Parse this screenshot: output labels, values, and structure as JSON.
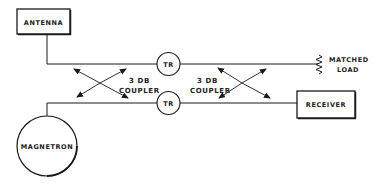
{
  "diagram": {
    "colors": {
      "line": "#1a1a1a",
      "background": "#ffffff",
      "text": "#222222"
    },
    "nodes": {
      "antenna": {
        "label": "ANTENNA",
        "shape": "rectangle"
      },
      "magnetron": {
        "label": "MAGNETRON",
        "shape": "circle"
      },
      "tr_top": {
        "label": "TR",
        "shape": "circle"
      },
      "tr_bottom": {
        "label": "TR",
        "shape": "circle"
      },
      "receiver": {
        "label": "RECEIVER",
        "shape": "rectangle"
      },
      "matched_load": {
        "label_line1": "MATCHED",
        "label_line2": "LOAD",
        "shape": "resistor"
      }
    },
    "couplers": [
      {
        "id": "left",
        "label_line1": "3 DB",
        "label_line2": "COUPLER"
      },
      {
        "id": "right",
        "label_line1": "3 DB",
        "label_line2": "COUPLER"
      }
    ]
  }
}
